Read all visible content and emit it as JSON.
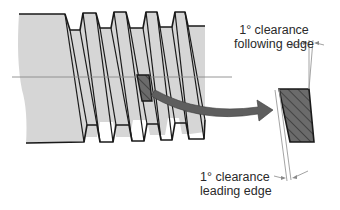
{
  "diagram": {
    "type": "thread-cutting-tool-clearance",
    "colors": {
      "workpiece_fill": "#d6d6d6",
      "outline": "#1a1a1a",
      "tool_fill": "#6b6b6b",
      "arrow_fill": "#5e5e5e",
      "centerline": "#8a8a8a",
      "leader": "#8a8a8a",
      "background": "#ffffff"
    },
    "labels": {
      "following": {
        "line1": "1° clearance",
        "line2": "following edge"
      },
      "leading": {
        "line1": "1° clearance",
        "line2": "leading edge"
      }
    }
  }
}
